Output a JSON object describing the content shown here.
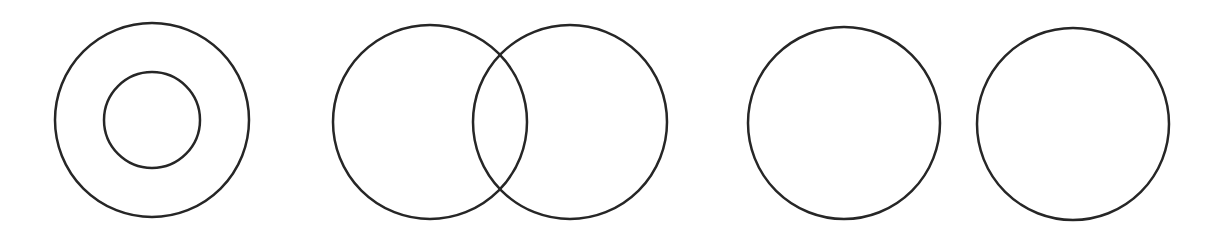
{
  "diagram": {
    "stroke_color": "#262626",
    "stroke_width": 2.5,
    "background": "#ffffff",
    "groups": [
      {
        "name": "containment",
        "circles": [
          {
            "name": "outer-circle",
            "cx": 152,
            "cy": 120,
            "r": 97
          },
          {
            "name": "inner-circle",
            "cx": 152,
            "cy": 120,
            "r": 48
          }
        ]
      },
      {
        "name": "overlap",
        "circles": [
          {
            "name": "left-circle",
            "cx": 430,
            "cy": 122,
            "r": 97
          },
          {
            "name": "right-circle",
            "cx": 570,
            "cy": 122,
            "r": 97
          }
        ]
      },
      {
        "name": "disjoint",
        "circles": [
          {
            "name": "left-circle",
            "cx": 844,
            "cy": 123,
            "r": 96
          },
          {
            "name": "right-circle",
            "cx": 1073,
            "cy": 124,
            "r": 96
          }
        ]
      }
    ]
  }
}
